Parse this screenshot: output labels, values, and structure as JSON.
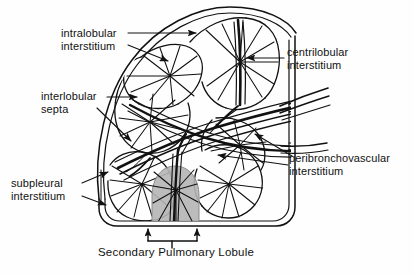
{
  "figure": {
    "title": "Secondary Pulmonary Lobule",
    "caption": "Secondary Pulmonary Lobule",
    "background_color": "#fefefe",
    "line_color": "#111111",
    "shading_color": "#b3b3b3"
  },
  "labels": {
    "intralobular": {
      "line1": "intralobular",
      "line2": "interstitium",
      "name": "intralobular interstitium"
    },
    "centrilobular": {
      "line1": "centrilobular",
      "line2": "interstitium",
      "name": "centrilobular interstitium"
    },
    "interlobular": {
      "line1": "interlobular",
      "line2": "septa",
      "name": "interlobular septa"
    },
    "peribronchovascular": {
      "line1": "peribronchovascular",
      "line2": "interstitium",
      "name": "peribronchovascular interstitium"
    },
    "subpleural": {
      "line1": "subpleural",
      "line2": "interstitium",
      "name": "subpleural interstitium"
    }
  },
  "diagram": {
    "structures": [
      "pleural-surface",
      "interlobular-septa",
      "bronchovascular-bundle",
      "centrilobular-core",
      "shaded-lobule",
      "measurement-bracket"
    ],
    "shaded_lobule_label": "Secondary Pulmonary Lobule",
    "arrow_count": 8
  }
}
